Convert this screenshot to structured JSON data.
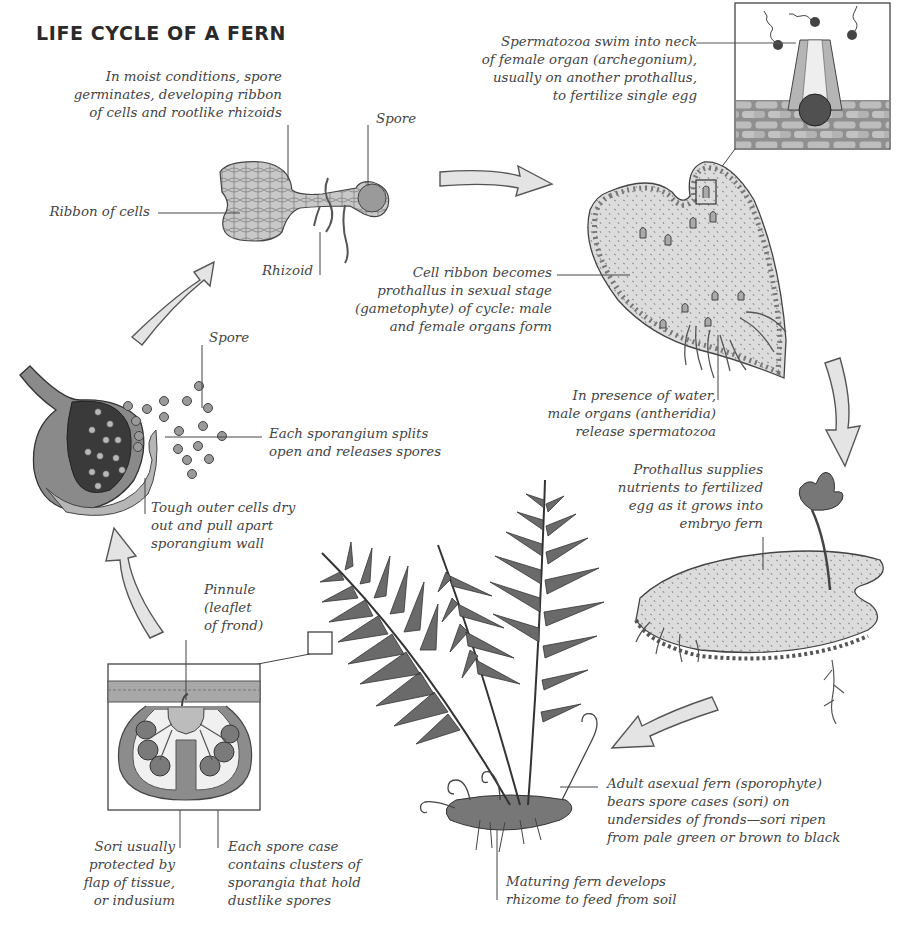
{
  "title": "LIFE CYCLE OF A FERN",
  "labels": {
    "germination": [
      "In moist conditions, spore",
      "germinates, developing ribbon",
      "of cells and rootlike rhizoids"
    ],
    "spore_top": "Spore",
    "ribbon_of_cells": "Ribbon of cells",
    "rhizoid": "Rhizoid",
    "spermatozoa_swim": [
      "Spermatozoa swim into neck",
      "of female organ (archegonium),",
      "usually on another prothallus,",
      "to fertilize single egg"
    ],
    "cell_ribbon_prothallus": [
      "Cell ribbon becomes",
      "prothallus in sexual stage",
      "(gametophyte) of cycle: male",
      "and female organs form"
    ],
    "antheridia": [
      "In presence of water,",
      "male organs (antheridia)",
      "release spermatozoa"
    ],
    "spore_mid": "Spore",
    "sporangium_splits": [
      "Each sporangium splits",
      "open and releases spores"
    ],
    "tough_outer_cells": [
      "Tough outer cells dry",
      "out and pull apart",
      "sporangium wall"
    ],
    "prothallus_supplies": [
      "Prothallus supplies",
      "nutrients to fertilized",
      "egg as it grows into",
      "embryo fern"
    ],
    "pinnule": [
      "Pinnule",
      "(leaflet",
      "of frond)"
    ],
    "sori_protected": [
      "Sori usually",
      "protected by",
      "flap of tissue,",
      "or indusium"
    ],
    "spore_case": [
      "Each spore case",
      "contains clusters of",
      "sporangia that hold",
      "dustlike spores"
    ],
    "adult_fern": [
      "Adult asexual fern (sporophyte)",
      "bears spore cases (sori) on",
      "undersides of fronds—sori ripen",
      "from pale green or brown to black"
    ],
    "maturing_fern": [
      "Maturing fern develops",
      "rhizome to feed from soil"
    ]
  },
  "stages": [
    {
      "name": "spore germination",
      "icon": "germinating-spore"
    },
    {
      "name": "prothallus (gametophyte)",
      "icon": "prothallus"
    },
    {
      "name": "archegonium detail",
      "icon": "archegonium-inset"
    },
    {
      "name": "embryo fern on prothallus",
      "icon": "embryo-fern"
    },
    {
      "name": "adult fern (sporophyte)",
      "icon": "adult-fern"
    },
    {
      "name": "sorus cross-section",
      "icon": "sorus-inset"
    },
    {
      "name": "sporangium releasing spores",
      "icon": "sporangium"
    }
  ],
  "colors": {
    "arrow_fill": "#e4e4e4",
    "arrow_stroke": "#555555",
    "tissue": "#cfcfcf",
    "dark": "#4a4a4a",
    "text": "#444444"
  }
}
